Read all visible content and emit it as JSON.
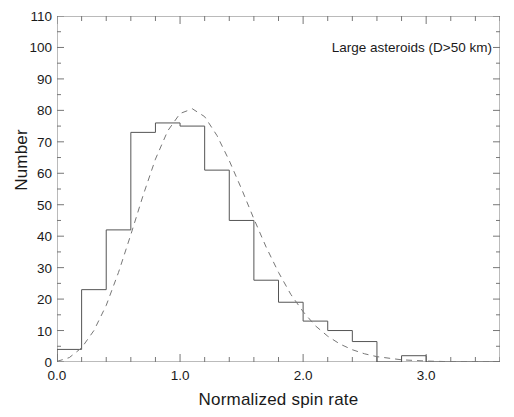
{
  "figure": {
    "ghost_top_text": "",
    "ghost_bottom_text": "",
    "annotation": "Large asteroids (D>50 km)"
  },
  "chart_data": {
    "type": "bar",
    "title": "",
    "subtitle": "",
    "xlabel": "Normalized spin rate",
    "ylabel": "Number",
    "xlim": [
      0.0,
      3.6
    ],
    "ylim": [
      0,
      110
    ],
    "grid": false,
    "legend_position": "none",
    "bin_width": 0.2,
    "x_major_ticks": [
      0.0,
      1.0,
      2.0,
      3.0
    ],
    "x_major_tick_labels": [
      "0.0",
      "1.0",
      "2.0",
      "3.0"
    ],
    "x_minor_tick_step": 0.2,
    "y_major_ticks": [
      0,
      10,
      20,
      30,
      40,
      50,
      60,
      70,
      80,
      90,
      100,
      110
    ],
    "y_major_tick_labels": [
      "0",
      "10",
      "20",
      "30",
      "40",
      "50",
      "60",
      "70",
      "80",
      "90",
      "100",
      "110"
    ],
    "y_minor_tick_step": 5,
    "bar_color": "#ffffff",
    "bar_edge_color": "#555555",
    "curve_color": "#777777",
    "axis_color": "#777777",
    "bin_edges": [
      0.0,
      0.2,
      0.4,
      0.6,
      0.8,
      1.0,
      1.2,
      1.4,
      1.6,
      1.8,
      2.0,
      2.2,
      2.4,
      2.6,
      2.8,
      3.0,
      3.2,
      3.4,
      3.6
    ],
    "categories": [
      "0.0-0.2",
      "0.2-0.4",
      "0.4-0.6",
      "0.6-0.8",
      "0.8-1.0",
      "1.0-1.2",
      "1.2-1.4",
      "1.4-1.6",
      "1.6-1.8",
      "1.8-2.0",
      "2.0-2.2",
      "2.2-2.4",
      "2.4-2.6",
      "2.6-2.8",
      "2.8-3.0",
      "3.0-3.2",
      "3.2-3.4",
      "3.4-3.6"
    ],
    "values": [
      4,
      23,
      42,
      73,
      76,
      75,
      61,
      45,
      26,
      19,
      13,
      10,
      6.5,
      0,
      2,
      0,
      0,
      0
    ],
    "series": [
      {
        "name": "Large asteroids (D>50 km) spin-rate histogram",
        "type": "bar",
        "values": [
          4,
          23,
          42,
          73,
          76,
          75,
          61,
          45,
          26,
          19,
          13,
          10,
          6.5,
          0,
          2,
          0,
          0,
          0
        ]
      },
      {
        "name": "Maxwellian fit",
        "type": "line",
        "style": "dashed",
        "peak_x": 1.0,
        "peak_y": 80,
        "x": [
          0.0,
          0.1,
          0.2,
          0.3,
          0.4,
          0.5,
          0.6,
          0.7,
          0.8,
          0.9,
          1.0,
          1.1,
          1.2,
          1.3,
          1.4,
          1.5,
          1.6,
          1.7,
          1.8,
          1.9,
          2.0,
          2.1,
          2.2,
          2.3,
          2.4,
          2.5,
          2.6,
          2.8,
          3.0,
          3.2,
          3.4,
          3.6
        ],
        "y": [
          0.2,
          1.4,
          4.5,
          10.0,
          18.0,
          28.5,
          40.5,
          53.0,
          64.5,
          73.5,
          79.0,
          80.5,
          78.0,
          72.0,
          64.0,
          55.0,
          45.5,
          36.5,
          28.5,
          21.5,
          16.0,
          11.5,
          8.2,
          5.7,
          3.9,
          2.6,
          1.7,
          0.7,
          0.3,
          0.1,
          0.05,
          0.0
        ]
      }
    ]
  }
}
